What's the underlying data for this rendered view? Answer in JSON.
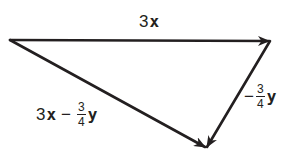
{
  "diagram": {
    "type": "vector-triangle",
    "stroke_color": "#231f20",
    "background": "#ffffff",
    "vertices": {
      "A": {
        "x": 10,
        "y": 40
      },
      "B": {
        "x": 270,
        "y": 41
      },
      "C": {
        "x": 206,
        "y": 148
      }
    },
    "vectors": [
      {
        "id": "top",
        "from": "A",
        "to": "B",
        "label": {
          "coefficient": "3",
          "variable": "x"
        }
      },
      {
        "id": "right",
        "from": "B",
        "to": "C",
        "label": {
          "sign": "−",
          "fraction": {
            "numerator": "3",
            "denominator": "4"
          },
          "variable": "y"
        }
      },
      {
        "id": "diagonal",
        "from": "A",
        "to": "C",
        "label": {
          "term1_coefficient": "3",
          "term1_variable": "x",
          "operator": "−",
          "fraction": {
            "numerator": "3",
            "denominator": "4"
          },
          "term2_variable": "y"
        }
      }
    ]
  }
}
